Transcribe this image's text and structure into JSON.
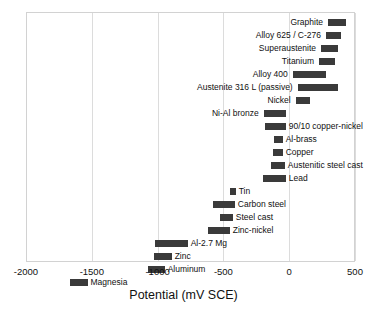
{
  "chart_data": {
    "type": "bar",
    "orientation": "horizontal-range",
    "title": "",
    "xlabel": "Potential (mV SCE)",
    "ylabel": "",
    "xlim": [
      -2000,
      500
    ],
    "xticks": [
      -2000,
      -1500,
      -1000,
      -500,
      0,
      500
    ],
    "xticklabels": [
      "-2000",
      "-1500",
      "-1000",
      "-500",
      "0",
      "500"
    ],
    "grid": true,
    "legend": false,
    "bar_color": "#3a3a3a",
    "categories": [
      "Graphite",
      "Alloy 625 / C-276",
      "Superaustenite",
      "Titanium",
      "Alloy 400",
      "Austenite 316 L (passive)",
      "Nickel",
      "Ni-Al bronze",
      "90/10 copper-nickel",
      "Al-brass",
      "Copper",
      "Austenitic steel cast",
      "Lead",
      "Tin",
      "Carbon steel",
      "Steel cast",
      "Zinc-nickel",
      "Al-2.7 Mg",
      "Zinc",
      "Aluminum",
      "Magnesia"
    ],
    "ranges": [
      {
        "label": "Graphite",
        "min": 287,
        "max": 425,
        "label_side": "left"
      },
      {
        "label": "Alloy 625 / C-276",
        "min": 272,
        "max": 386,
        "label_side": "left"
      },
      {
        "label": "Superaustenite",
        "min": 234,
        "max": 363,
        "label_side": "left"
      },
      {
        "label": "Titanium",
        "min": 219,
        "max": 340,
        "label_side": "left"
      },
      {
        "label": "Alloy 400",
        "min": 19,
        "max": 269,
        "label_side": "left"
      },
      {
        "label": "Austenite 316 L (passive)",
        "min": 57,
        "max": 360,
        "label_side": "left"
      },
      {
        "label": "Nickel",
        "min": 42,
        "max": 148,
        "label_side": "left"
      },
      {
        "label": "Ni-Al bronze",
        "min": -201,
        "max": -33,
        "label_side": "left"
      },
      {
        "label": "90/10 copper-nickel",
        "min": -193,
        "max": -34,
        "label_side": "right"
      },
      {
        "label": "Al-brass",
        "min": -125,
        "max": -57,
        "label_side": "right"
      },
      {
        "label": "Copper",
        "min": -133,
        "max": -57,
        "label_side": "right"
      },
      {
        "label": "Austenitic steel cast",
        "min": -148,
        "max": -41,
        "label_side": "right"
      },
      {
        "label": "Lead",
        "min": -209,
        "max": -34,
        "label_side": "right"
      },
      {
        "label": "Tin",
        "min": -459,
        "max": -414,
        "label_side": "right"
      },
      {
        "label": "Carbon steel",
        "min": -588,
        "max": -421,
        "label_side": "right"
      },
      {
        "label": "Steel cast",
        "min": -535,
        "max": -436,
        "label_side": "right"
      },
      {
        "label": "Zinc-nickel",
        "min": -627,
        "max": -459,
        "label_side": "right"
      },
      {
        "label": "Al-2.7 Mg",
        "min": -1030,
        "max": -779,
        "label_side": "right"
      },
      {
        "label": "Zinc",
        "min": -1038,
        "max": -901,
        "label_side": "right"
      },
      {
        "label": "Aluminum",
        "min": -1084,
        "max": -954,
        "label_side": "right"
      },
      {
        "label": "Magnesia",
        "min": -1677,
        "max": -1540,
        "label_side": "right"
      }
    ]
  }
}
